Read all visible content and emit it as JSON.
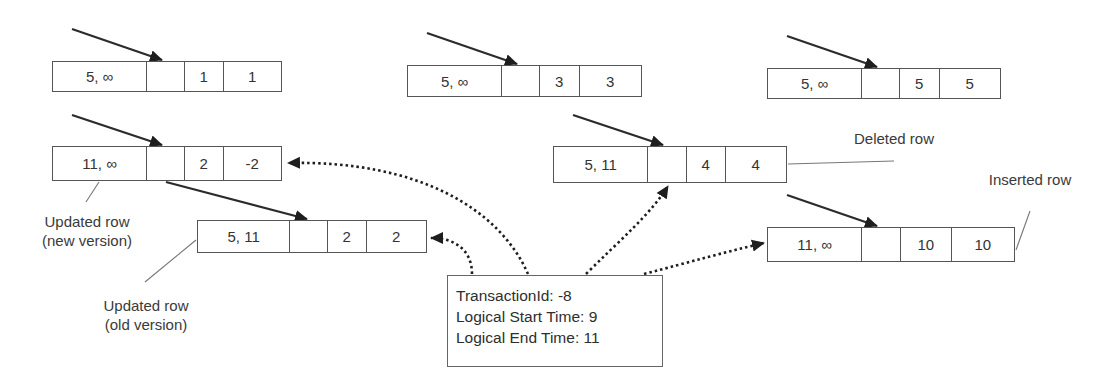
{
  "diagram": {
    "rows": [
      {
        "id": "row-1",
        "cells": [
          "5, ∞",
          "",
          "1",
          "1"
        ],
        "box": [
          52,
          61,
          230,
          31
        ],
        "widths": [
          95,
          38,
          39,
          58
        ]
      },
      {
        "id": "row-3",
        "cells": [
          "5, ∞",
          "",
          "3",
          "3"
        ],
        "box": [
          407,
          65,
          235,
          32
        ],
        "widths": [
          95,
          38,
          40,
          62
        ]
      },
      {
        "id": "row-5",
        "cells": [
          "5, ∞",
          "",
          "5",
          "5"
        ],
        "box": [
          767,
          68,
          234,
          31
        ],
        "widths": [
          95,
          38,
          40,
          61
        ]
      },
      {
        "id": "row-2-new",
        "cells": [
          "11, ∞",
          "",
          "2",
          "-2"
        ],
        "box": [
          52,
          146,
          230,
          35
        ],
        "widths": [
          95,
          38,
          39,
          58
        ]
      },
      {
        "id": "row-4-deleted",
        "cells": [
          "5, 11",
          "",
          "4",
          "4"
        ],
        "box": [
          553,
          146,
          234,
          37
        ],
        "widths": [
          95,
          39,
          39,
          61
        ]
      },
      {
        "id": "row-2-old",
        "cells": [
          "5, 11",
          "",
          "2",
          "2"
        ],
        "box": [
          197,
          220,
          230,
          33
        ],
        "widths": [
          93,
          38,
          39,
          60
        ]
      },
      {
        "id": "row-10-inserted",
        "cells": [
          "11, ∞",
          "",
          "10",
          "10"
        ],
        "box": [
          767,
          227,
          248,
          35
        ],
        "widths": [
          95,
          39,
          51,
          63
        ]
      }
    ],
    "labels": {
      "updated_new_line1": "Updated row",
      "updated_new_line2": "(new version)",
      "updated_old_line1": "Updated row",
      "updated_old_line2": "(old version)",
      "deleted": "Deleted row",
      "inserted": "Inserted row"
    },
    "transaction": {
      "id_line": "TransactionId: -8",
      "start_line": "Logical Start Time: 9",
      "end_line": "Logical End Time: 11"
    },
    "colors": {
      "line": "#2b2b2b",
      "box_border": "#555555",
      "callout": "#777777"
    }
  }
}
